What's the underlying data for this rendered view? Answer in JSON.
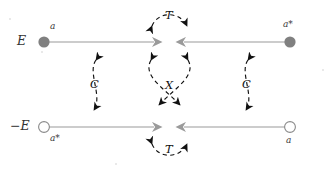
{
  "figure": {
    "background_color": "#ffffff"
  },
  "colors": {
    "mode_line": "#9a9a9a",
    "mode_arrow": "#9a9a9a",
    "filled_node": "#808080",
    "hollow_node_stroke": "#8a8a8a",
    "hollow_node_fill": "#ffffff",
    "operator_curve": "#111111",
    "label_text": "#2b2b2b"
  },
  "levels": {
    "upper": {
      "energy_label": "E",
      "left_node": {
        "type": "filled",
        "mode_label": "a"
      },
      "right_node": {
        "type": "filled",
        "mode_label": "a*"
      }
    },
    "lower": {
      "energy_label": "−E",
      "left_node": {
        "type": "hollow",
        "mode_label": "a*"
      },
      "right_node": {
        "type": "hollow",
        "mode_label": "a"
      }
    }
  },
  "operators": {
    "time_reversal_top": {
      "symbol": "𝒯",
      "plain": "T",
      "name": "time-reversal",
      "placement": "above-upper-level"
    },
    "time_reversal_bottom": {
      "symbol": "𝒯",
      "plain": "T",
      "name": "time-reversal",
      "placement": "below-lower-level"
    },
    "charge_conjugation_left": {
      "symbol": "𝒞",
      "plain": "C",
      "name": "charge-conjugation",
      "placement": "left-between-levels"
    },
    "charge_conjugation_right": {
      "symbol": "𝒞",
      "plain": "C",
      "name": "charge-conjugation",
      "placement": "right-between-levels"
    },
    "chiral_center": {
      "symbol": "𝒳",
      "plain": "X",
      "name": "chiral",
      "placement": "center-between-levels"
    }
  },
  "geometry": {
    "upper_line_y": 42,
    "lower_line_y": 127,
    "left_node_x": 44,
    "right_node_x": 290,
    "center_left_arrow_x": 160,
    "center_right_arrow_x": 178
  }
}
